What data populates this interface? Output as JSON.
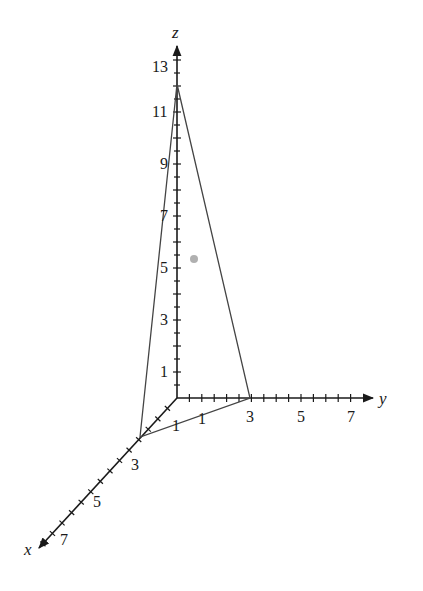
{
  "diagram": {
    "type": "3d-coordinate-plot",
    "axes": {
      "x": {
        "label": "x",
        "tick_labels": [
          "1",
          "3",
          "5",
          "7"
        ]
      },
      "y": {
        "label": "y",
        "tick_labels": [
          "1",
          "3",
          "5",
          "7"
        ]
      },
      "z": {
        "label": "z",
        "tick_labels": [
          "1",
          "3",
          "5",
          "7",
          "9",
          "11",
          "13"
        ]
      }
    },
    "triangle": {
      "vertices": [
        {
          "name": "x-intercept",
          "coords": [
            3,
            0,
            0
          ]
        },
        {
          "name": "y-intercept",
          "coords": [
            0,
            3,
            0
          ]
        },
        {
          "name": "z-intercept",
          "coords": [
            0,
            0,
            12
          ]
        }
      ]
    },
    "point": {
      "color": "#b0b0b0"
    },
    "colors": {
      "axis": "#1a1a1a",
      "triangle": "#444444",
      "background": "#ffffff"
    }
  },
  "labels": {
    "x_axis": "x",
    "y_axis": "y",
    "z_axis": "z",
    "z_ticks": {
      "t1": "1",
      "t3": "3",
      "t5": "5",
      "t7": "7",
      "t9": "9",
      "t11": "11",
      "t13": "13"
    },
    "y_ticks": {
      "t1": "1",
      "t3": "3",
      "t5": "5",
      "t7": "7"
    },
    "x_ticks": {
      "t1": "1",
      "t3": "3",
      "t5": "5",
      "t7": "7"
    }
  }
}
